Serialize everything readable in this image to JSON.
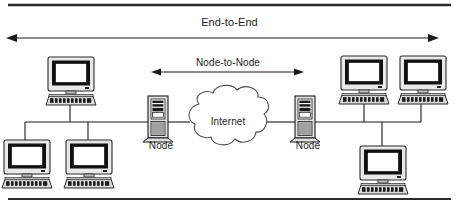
{
  "diagram": {
    "frame": {
      "top_rule": "top-border-rule",
      "bottom_rule": "bottom-border-rule"
    },
    "arrows": [
      {
        "id": "end-to-end",
        "label": "End-to-End",
        "heads": "both",
        "x1": 8,
        "x2": 437,
        "y": 38
      },
      {
        "id": "node-to-node",
        "label": "Node-to-Node",
        "heads": "both",
        "x1": 152,
        "x2": 303,
        "y": 72
      }
    ],
    "cloud": {
      "label": "Internet",
      "cx": 228,
      "cy": 122
    },
    "nodes": [
      {
        "id": "node-left",
        "label": "Node",
        "x": 148,
        "y": 96
      },
      {
        "id": "node-right",
        "label": "Node",
        "x": 295,
        "y": 96
      }
    ],
    "workstations": [
      {
        "id": "workstation-left-top",
        "x": 48,
        "y": 57
      },
      {
        "id": "workstation-left-bottom-1",
        "x": 12,
        "y": 134
      },
      {
        "id": "workstation-left-bottom-2",
        "x": 70,
        "y": 134
      },
      {
        "id": "workstation-right-top-1",
        "x": 341,
        "y": 53
      },
      {
        "id": "workstation-right-top-2",
        "x": 400,
        "y": 53
      },
      {
        "id": "workstation-right-bottom",
        "x": 358,
        "y": 141
      }
    ],
    "bus_lines": [
      {
        "id": "bus-left",
        "x1": 25,
        "x2": 155,
        "y": 122
      },
      {
        "id": "bus-right",
        "x1": 310,
        "x2": 421,
        "y": 122
      }
    ],
    "colors": {
      "line": "#1b1b1b",
      "rule": "#2b2b2b",
      "screen": "#ffffff",
      "bezel": "#111111",
      "case": "#d6d6d6",
      "case_light": "#eeeeee",
      "cloud_stroke": "#4a4a4a",
      "text": "#1b1b1b",
      "background": "#ffffff"
    }
  }
}
